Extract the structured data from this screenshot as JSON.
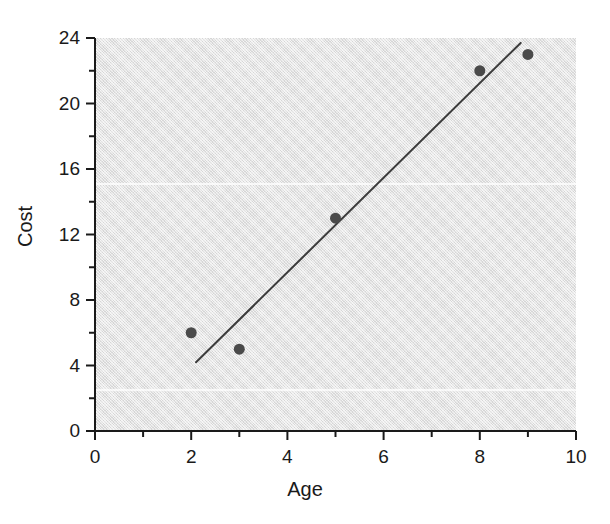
{
  "chart_data": {
    "type": "scatter",
    "title": "",
    "subtitle": "",
    "xlabel": "Age",
    "ylabel": "Cost",
    "xlim": [
      0,
      10
    ],
    "ylim": [
      0,
      24
    ],
    "x_major_ticks": [
      0,
      2,
      4,
      6,
      8,
      10
    ],
    "x_minor_ticks": [
      1,
      3,
      5,
      7,
      9
    ],
    "y_major_ticks": [
      0,
      4,
      8,
      12,
      16,
      20,
      24
    ],
    "y_minor_ticks": [
      2,
      6,
      10,
      14,
      18,
      22
    ],
    "x_tick_labels": [
      "0",
      "2",
      "4",
      "6",
      "8",
      "10"
    ],
    "y_tick_labels": [
      "0",
      "4",
      "8",
      "12",
      "16",
      "20",
      "24"
    ],
    "grid": false,
    "legend": null,
    "legend_position": "none",
    "plot_background_color": "#e3e3e3",
    "figure_background_color": "#ffffff",
    "marker_color": "#4a4a4a",
    "marker_shape": "circle",
    "marker_size": 11,
    "axis_color": "#1a1a1a",
    "series": [
      {
        "name": "observations",
        "type": "scatter",
        "points": [
          {
            "x": 2,
            "y": 6
          },
          {
            "x": 3,
            "y": 5
          },
          {
            "x": 5,
            "y": 13
          },
          {
            "x": 8,
            "y": 22
          },
          {
            "x": 9,
            "y": 23
          }
        ]
      },
      {
        "name": "fitted-line",
        "type": "line",
        "color": "#3c3c3c",
        "width": 2,
        "endpoints": [
          {
            "x": 2.1,
            "y": 4.2
          },
          {
            "x": 8.85,
            "y": 23.7
          }
        ]
      }
    ],
    "annotations": []
  },
  "axis_titles": {
    "x": "Age",
    "y": "Cost"
  }
}
